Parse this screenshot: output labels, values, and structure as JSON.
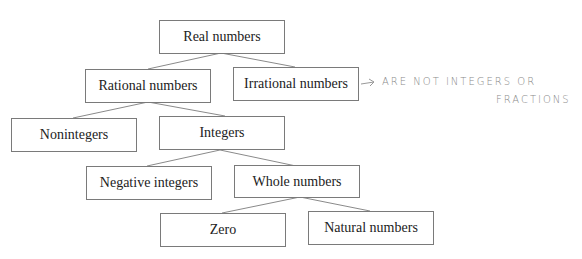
{
  "diagram": {
    "nodes": [
      {
        "id": "real",
        "label": "Real numbers"
      },
      {
        "id": "rational",
        "label": "Rational numbers"
      },
      {
        "id": "irrational",
        "label": "Irrational numbers"
      },
      {
        "id": "nonintegers",
        "label": "Nonintegers"
      },
      {
        "id": "integers",
        "label": "Integers"
      },
      {
        "id": "negative",
        "label": "Negative integers"
      },
      {
        "id": "whole",
        "label": "Whole numbers"
      },
      {
        "id": "zero",
        "label": "Zero"
      },
      {
        "id": "natural",
        "label": "Natural numbers"
      }
    ],
    "edges": [
      [
        "real",
        "rational"
      ],
      [
        "real",
        "irrational"
      ],
      [
        "rational",
        "nonintegers"
      ],
      [
        "rational",
        "integers"
      ],
      [
        "integers",
        "negative"
      ],
      [
        "integers",
        "whole"
      ],
      [
        "whole",
        "zero"
      ],
      [
        "whole",
        "natural"
      ]
    ],
    "annotation": {
      "arrow": "→",
      "line1": "ARE NOT INTEGERS OR",
      "line2": "FRACTIONS"
    }
  }
}
